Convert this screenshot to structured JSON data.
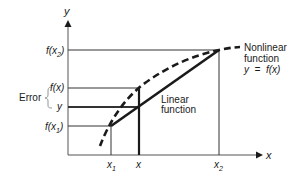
{
  "figure": {
    "type": "linear-interpolation-error-diagram",
    "axes": {
      "x_label": "x",
      "y_label": "y"
    },
    "y_ticks": [
      {
        "id": "fx2",
        "label": "f(x",
        "sub": "2",
        "suffix": ")"
      },
      {
        "id": "fx",
        "label": "f(x)"
      },
      {
        "id": "y",
        "label": "y"
      },
      {
        "id": "fx1",
        "label": "f(x",
        "sub": "1",
        "suffix": ")"
      }
    ],
    "x_ticks": [
      {
        "id": "x1",
        "label": "x",
        "sub": "1"
      },
      {
        "id": "x",
        "label": "x"
      },
      {
        "id": "x2",
        "label": "x",
        "sub": "2"
      }
    ],
    "annotations": {
      "error_label": "Error",
      "nonlinear_line1": "Nonlinear",
      "nonlinear_line2": "function",
      "nonlinear_line3": "y  =  f(x)",
      "linear_line1": "Linear",
      "linear_line2": "function"
    },
    "colors": {
      "ink": "#1a1a1a",
      "axis": "#555555",
      "background": "#ffffff"
    }
  }
}
